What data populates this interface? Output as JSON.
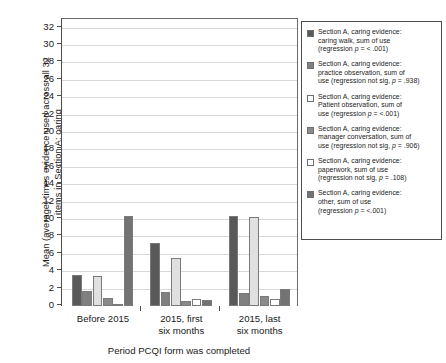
{
  "chart_data": {
    "type": "bar",
    "title": "",
    "xlabel": "Period PCQI form was completed",
    "ylabel": "Mean (average) times evidence used across all 32\nitems in Section A: caring",
    "categories": [
      "Before 2015",
      "2015, first\nsix months",
      "2015, last\nsix months"
    ],
    "ylim": [
      0,
      33
    ],
    "yticks": [
      0,
      2,
      4,
      6,
      8,
      10,
      12,
      14,
      16,
      18,
      20,
      22,
      24,
      26,
      28,
      30,
      32
    ],
    "grid": true,
    "legend_position": "right",
    "series": [
      {
        "name": "caring walk",
        "color": "#595959",
        "values": [
          3.6,
          7.2,
          10.4
        ]
      },
      {
        "name": "practice observation",
        "color": "#808080",
        "values": [
          1.7,
          1.65,
          1.45
        ]
      },
      {
        "name": "Patient observation",
        "color": "#e0e0e0",
        "values": [
          3.4,
          5.55,
          10.2
        ]
      },
      {
        "name": "manager conversation",
        "color": "#8a8a8a",
        "values": [
          0.95,
          0.6,
          1.1
        ]
      },
      {
        "name": "paperwork",
        "color": "#ffffff",
        "values": [
          0.25,
          0.85,
          0.8
        ]
      },
      {
        "name": "other",
        "color": "#737373",
        "values": [
          10.3,
          0.65,
          1.95
        ]
      }
    ]
  },
  "legend": {
    "items": [
      {
        "swatch": "#595959",
        "text": "Section A, caring evidence:\ncaring walk, sum of use\n(regression p = < .001)"
      },
      {
        "swatch": "#808080",
        "text": "Section A, caring evidence:\npractice observation, sum of\nuse (regression not sig, p = .938)"
      },
      {
        "swatch": "#ffffff",
        "text": "Section A, caring evidence:\nPatient observation, sum of\nuse (regression p = <.001)"
      },
      {
        "swatch": "#8a8a8a",
        "text": "Section A, caring evidence:\nmanager conversation, sum of\nuse (regression not sig, p = .906)"
      },
      {
        "swatch": "#ffffff",
        "text": "Section A, caring evidence:\npaperwork, sum of use\n(regression not sig, p = .108)"
      },
      {
        "swatch": "#737373",
        "text": "Section A, caring evidence:\nother, sum of use\n(regression p = <.001)"
      }
    ]
  }
}
